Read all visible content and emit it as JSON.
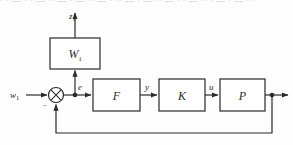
{
  "figure": {
    "type": "block-diagram",
    "clipped_scan_text": "· · — · · — ·· — · — ·· — · ·· — · — ·· — · · — ·· · — · — ··"
  },
  "blocks": [
    {
      "id": "W1",
      "label": "W",
      "subscript": "1",
      "name": "weighting-block"
    },
    {
      "id": "F",
      "label": "F",
      "subscript": "",
      "name": "filter-block"
    },
    {
      "id": "K",
      "label": "K",
      "subscript": "",
      "name": "controller-block"
    },
    {
      "id": "P",
      "label": "P",
      "subscript": "",
      "name": "plant-block"
    }
  ],
  "signals": {
    "input": {
      "label": "w",
      "subscript": "1"
    },
    "error": {
      "label": "e",
      "subscript": ""
    },
    "z_output": {
      "label": "z",
      "subscript": "1"
    },
    "f_output": {
      "label": "y",
      "subscript": ""
    },
    "k_output": {
      "label": "u",
      "subscript": ""
    },
    "feedback_sign": "−"
  },
  "colors": {
    "line": "#2a2a2a",
    "block_border": "#3a3a3a",
    "block_fill": "#ffffff",
    "background": "#fdfdfd",
    "label_text": "#2a2a2a",
    "sign_text": "#6e6e72",
    "scan_text": "#b9b9bd"
  }
}
